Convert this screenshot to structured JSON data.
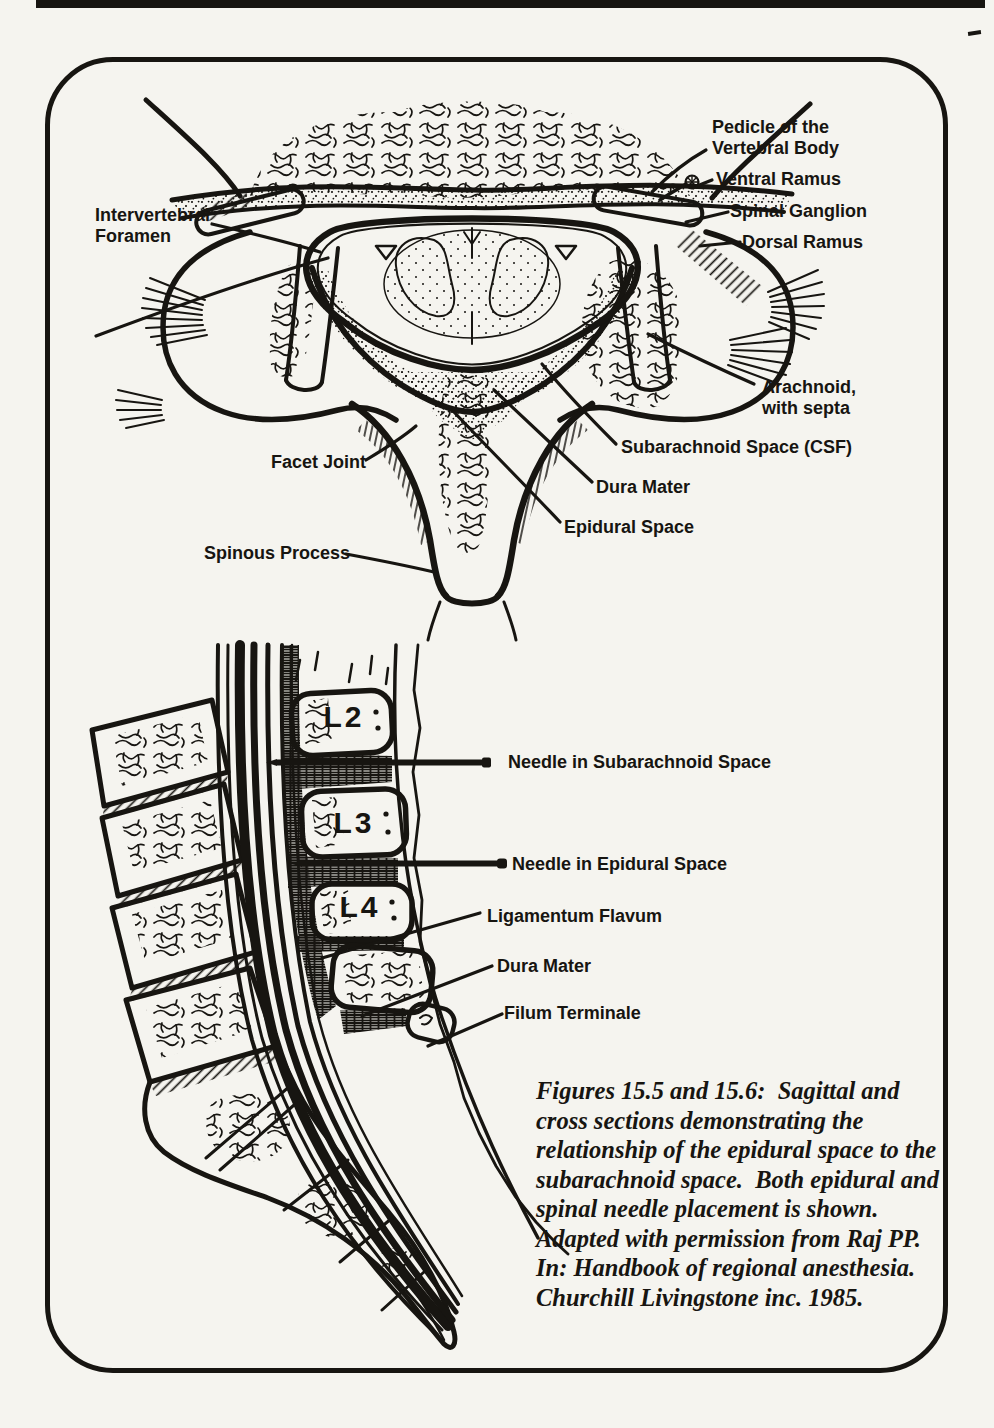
{
  "page": {
    "background": "#f5f4ef",
    "ink": "#171511"
  },
  "top_figure": {
    "name": "spinal cross section",
    "labels": {
      "pedicle": "Pedicle of the\nVertebral Body",
      "ventral_ramus": "Ventral Ramus",
      "spinal_ganglion": "Spinal Ganglion",
      "dorsal_ramus": "Dorsal Ramus",
      "intervertebral_foramen": "Intervertebral\nForamen",
      "arachnoid": "Arachnoid,\nwith septa",
      "subarachnoid_space": "Subarachnoid Space (CSF)",
      "dura_mater": "Dura Mater",
      "epidural_space": "Epidural Space",
      "facet_joint": "Facet Joint",
      "spinous_process": "Spinous Process"
    }
  },
  "bottom_figure": {
    "name": "lumbar sagittal section",
    "vertebrae": [
      "L2",
      "L3",
      "L4"
    ],
    "labels": {
      "needle_subarachnoid": "Needle in Subarachnoid Space",
      "needle_epidural": "Needle in Epidural Space",
      "ligamentum_flavum": "Ligamentum Flavum",
      "dura_mater": "Dura Mater",
      "filum_terminale": "Filum Terminale"
    }
  },
  "caption": {
    "text": "Figures 15.5 and 15.6:  Sagittal and\ncross sections demonstrating the\nrelationship of the epidural space to the\nsubarachnoid space.  Both epidural and\nspinal needle placement is shown.\nAdapted with permission from Raj PP.\nIn: Handbook of regional anesthesia.\nChurchill Livingstone inc. 1985."
  }
}
